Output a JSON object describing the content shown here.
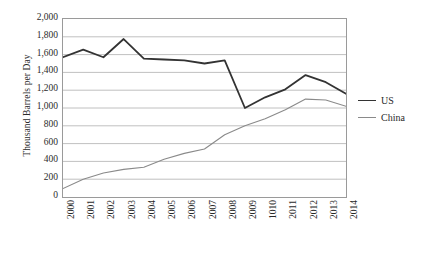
{
  "chart_data": {
    "type": "line",
    "title": "",
    "xlabel": "",
    "ylabel": "Thousand Barrels per Day",
    "ylim": [
      0,
      2000
    ],
    "ytick_labels": [
      "2,000",
      "1,800",
      "1,600",
      "1,400",
      "1,200",
      "1,000",
      "800",
      "600",
      "400",
      "200",
      "0"
    ],
    "ytick_values": [
      2000,
      1800,
      1600,
      1400,
      1200,
      1000,
      800,
      600,
      400,
      200,
      0
    ],
    "grid": true,
    "grid_axis": "y",
    "legend_position": "right",
    "categories": [
      "2000",
      "2001",
      "2002",
      "2003",
      "2004",
      "2005",
      "2006",
      "2007",
      "2008",
      "2009",
      "1010",
      "2011",
      "2012",
      "2013",
      "2014"
    ],
    "series": [
      {
        "name": "US",
        "color": "#333333",
        "width": 1.8,
        "values": [
          1570,
          1655,
          1570,
          1775,
          1555,
          1545,
          1535,
          1500,
          1535,
          1000,
          1120,
          1210,
          1370,
          1290,
          1160
        ]
      },
      {
        "name": "China",
        "color": "#8a8a8a",
        "width": 1.1,
        "values": [
          95,
          200,
          270,
          310,
          335,
          425,
          490,
          540,
          700,
          800,
          880,
          980,
          1100,
          1090,
          1020
        ]
      }
    ]
  },
  "legend": {
    "items": [
      {
        "label": "US"
      },
      {
        "label": "China"
      }
    ]
  },
  "colors": {
    "series_us": "#333333",
    "series_china": "#8a8a8a",
    "grid": "#b0b0b0",
    "frame": "#9a9a9a",
    "text": "#2b2b2b",
    "background": "#ffffff"
  }
}
